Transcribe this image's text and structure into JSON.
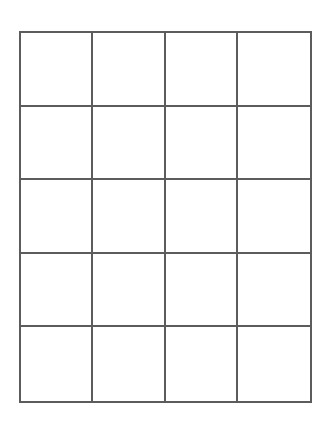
{
  "grid": {
    "rows": 5,
    "columns": 4,
    "line_color": "#5c5c5c",
    "background": "#ffffff",
    "cells": [
      [
        "",
        "",
        "",
        ""
      ],
      [
        "",
        "",
        "",
        ""
      ],
      [
        "",
        "",
        "",
        ""
      ],
      [
        "",
        "",
        "",
        ""
      ],
      [
        "",
        "",
        "",
        ""
      ]
    ]
  }
}
